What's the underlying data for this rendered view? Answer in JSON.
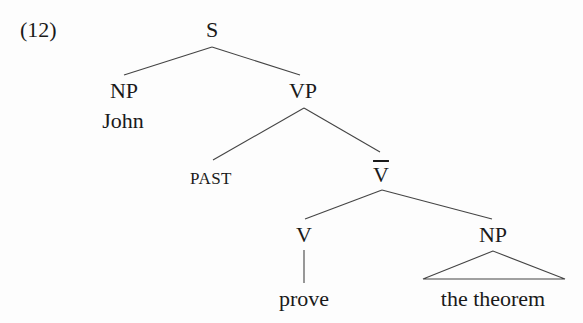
{
  "example_number": "(12)",
  "tree": {
    "root": "S",
    "nodes": {
      "s": "S",
      "np_subject": "NP",
      "john": "John",
      "vp": "VP",
      "past": "PAST",
      "vbar": "V",
      "v": "V",
      "prove": "prove",
      "np_object": "NP",
      "the_theorem": "the theorem"
    },
    "structure": "[S [NP John] [VP PAST [V-bar [V prove] [NP the theorem]]]]"
  }
}
